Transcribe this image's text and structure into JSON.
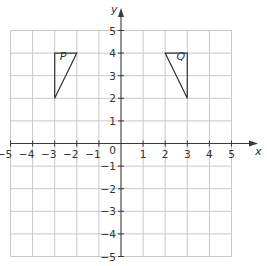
{
  "diagram": {
    "type": "coordinate-grid",
    "x_axis": {
      "label": "x",
      "min": -5,
      "max": 5,
      "ticks": [
        -5,
        -4,
        -3,
        -2,
        -1,
        1,
        2,
        3,
        4,
        5
      ]
    },
    "y_axis": {
      "label": "y",
      "min": -5,
      "max": 5,
      "ticks": [
        5,
        4,
        3,
        2,
        1,
        -1,
        -2,
        -3,
        -4,
        -5
      ]
    },
    "origin_label": "0",
    "shapes": [
      {
        "name": "P",
        "label": "P",
        "vertices": [
          [
            -3,
            4
          ],
          [
            -2,
            4
          ],
          [
            -3,
            2
          ]
        ]
      },
      {
        "name": "Q",
        "label": "Q",
        "vertices": [
          [
            2,
            4
          ],
          [
            3,
            4
          ],
          [
            3,
            2
          ]
        ]
      }
    ],
    "colors": {
      "grid": "#c8c8c8",
      "axis": "#3a3a3a",
      "shape": "#333333"
    }
  }
}
